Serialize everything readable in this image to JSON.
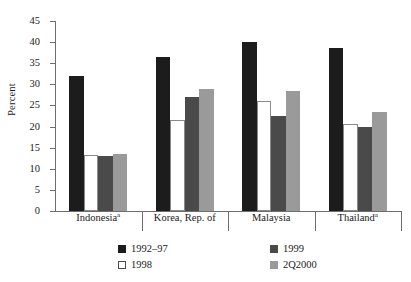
{
  "chart_data": {
    "type": "bar",
    "title": "",
    "xlabel": "",
    "ylabel": "Percent",
    "ylim": [
      0,
      45
    ],
    "yticks": [
      0,
      5,
      10,
      15,
      20,
      25,
      30,
      35,
      40,
      45
    ],
    "grid": false,
    "legend_position": "bottom",
    "categories": [
      "Indonesiaᵃ",
      "Korea, Rep. of",
      "Malaysia",
      "Thailandᵃ"
    ],
    "category_labels_plain": [
      "Indonesia",
      "Korea, Rep. of",
      "Malaysia",
      "Thailand"
    ],
    "category_footnotes": [
      "a",
      "",
      "",
      "a"
    ],
    "series": [
      {
        "name": "1992–97",
        "color": "#1c1c1c",
        "values": [
          32.0,
          36.5,
          40.0,
          38.5
        ]
      },
      {
        "name": "1998",
        "color": "#ffffff",
        "values": [
          13.2,
          21.5,
          26.0,
          20.5
        ]
      },
      {
        "name": "1999",
        "color": "#4a4a4a",
        "values": [
          13.0,
          27.0,
          22.5,
          20.0
        ]
      },
      {
        "name": "2Q2000",
        "color": "#9a9a9a",
        "values": [
          13.5,
          29.0,
          28.5,
          23.5
        ]
      }
    ]
  },
  "legend": {
    "entries": [
      {
        "label": "1992–97",
        "swatch": "black-filled-square-icon"
      },
      {
        "label": "1998",
        "swatch": "white-outlined-square-icon"
      },
      {
        "label": "1999",
        "swatch": "dark-gray-square-icon"
      },
      {
        "label": "2Q2000",
        "swatch": "light-gray-square-icon"
      }
    ]
  }
}
